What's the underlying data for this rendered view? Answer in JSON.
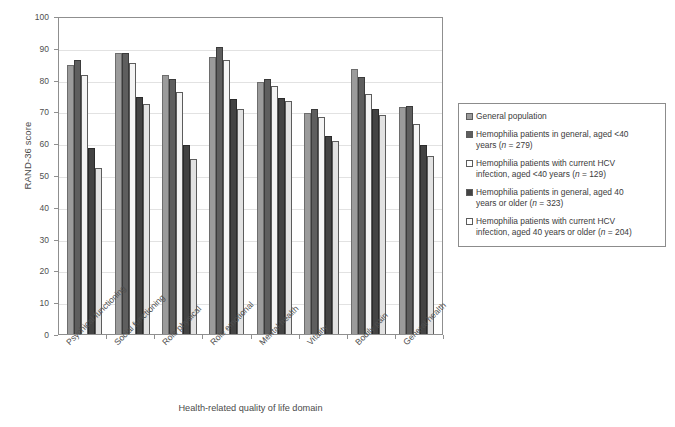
{
  "chart_data": {
    "type": "bar",
    "title": "",
    "xlabel": "Health-related quality of life domain",
    "ylabel": "RAND-36 score",
    "ylim": [
      0,
      100
    ],
    "ytick_step": 10,
    "yticks": [
      0,
      10,
      20,
      30,
      40,
      50,
      60,
      70,
      80,
      90,
      100
    ],
    "grid": true,
    "legend_position": "right",
    "categories": [
      "Psychical functioning",
      "Social functioning",
      "Role physical",
      "Role emotional",
      "Mental health",
      "Vitality",
      "Bodily pain",
      "General health"
    ],
    "series": [
      {
        "name": "General population",
        "color": "#9b9b9b",
        "values": [
          84.5,
          88.3,
          81.5,
          87.2,
          79.4,
          69.4,
          83.2,
          71.4
        ]
      },
      {
        "name": "Hemophilia patients in general, aged <40 years (n = 279)",
        "color": "#5e5e5e",
        "values": [
          86.3,
          88.3,
          80.1,
          90.3,
          80.2,
          70.7,
          80.7,
          71.6
        ]
      },
      {
        "name": "Hemophilia patients with current HCV infection, aged <40 years (n = 129)",
        "color": "#f4f4f4",
        "values": [
          81.5,
          85.3,
          76.2,
          86.3,
          78.1,
          68.1,
          75.6,
          66.0
        ]
      },
      {
        "name": "Hemophilia patients in general, aged 40 years or older (n = 323)",
        "color": "#434343",
        "values": [
          58.6,
          74.6,
          59.5,
          73.8,
          74.3,
          62.3,
          70.9,
          59.3
        ]
      },
      {
        "name": "Hemophilia patients with current HCV infection, aged 40 years or older (n = 204)",
        "color": "#e2e2e2",
        "values": [
          52.3,
          72.3,
          54.9,
          70.7,
          73.4,
          60.8,
          69.0,
          56.0
        ]
      }
    ]
  },
  "legend": {
    "entries": [
      {
        "swatch": "#9b9b9b",
        "line1": "General population",
        "line2": ""
      },
      {
        "swatch": "#5e5e5e",
        "line1": "Hemophilia patients in general, aged <40",
        "line2": "years (n = 279)"
      },
      {
        "swatch": "#ffffff",
        "line1": "Hemophilia patients with current HCV",
        "line2": "infection, aged <40 years (n = 129)"
      },
      {
        "swatch": "#434343",
        "line1": "Hemophilia patients in general, aged 40",
        "line2": "years or older (n = 323)"
      },
      {
        "swatch": "#ffffff",
        "line1": "Hemophilia patients with current HCV",
        "line2": "infection, aged 40 years or older (n = 204)"
      }
    ]
  }
}
